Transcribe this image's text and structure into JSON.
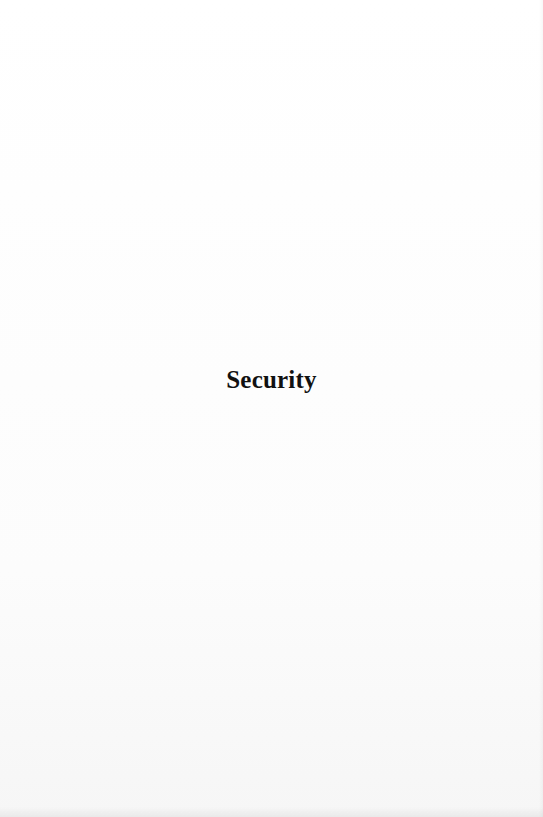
{
  "page": {
    "title": "Security"
  }
}
